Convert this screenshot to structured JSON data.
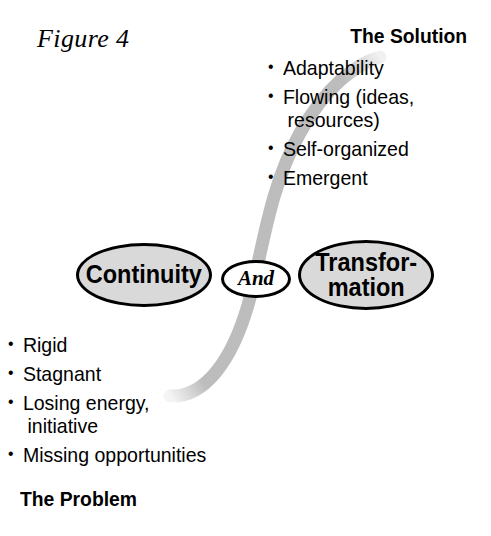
{
  "figure": {
    "label": "Figure 4"
  },
  "solution": {
    "heading": "The Solution",
    "bullets": [
      {
        "text": "Adaptability"
      },
      {
        "text": "Flowing (ideas,",
        "continuation": "resources)"
      },
      {
        "text": "Self-organized"
      },
      {
        "text": "Emergent"
      }
    ]
  },
  "problem": {
    "heading": "The Problem",
    "bullets": [
      {
        "text": "Rigid"
      },
      {
        "text": "Stagnant"
      },
      {
        "text": "Losing energy,",
        "continuation": "initiative"
      },
      {
        "text": "Missing opportunities"
      }
    ]
  },
  "nodes": {
    "continuity": {
      "label": "Continuity"
    },
    "connector": {
      "label": "And"
    },
    "transformation": {
      "line1": "Transfor-",
      "line2": "mation"
    }
  },
  "colors": {
    "background": "#ffffff",
    "ink": "#000000",
    "node_fill": "#d9d9d9",
    "connector_fill": "#ffffff",
    "curve_gray": "#b9b9b9"
  },
  "curve": {
    "name": "s-curve",
    "description": "gray S-shaped band sweeping from lower-left to upper-right"
  }
}
